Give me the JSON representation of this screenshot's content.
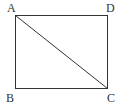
{
  "figure": {
    "type": "rectangle-with-diagonal",
    "stroke_color": "#333333",
    "background": "#ffffff",
    "vertices": [
      {
        "label": "A",
        "x": 15,
        "y": 15,
        "label_x": 7,
        "label_y": 12
      },
      {
        "label": "D",
        "x": 108,
        "y": 15,
        "label_x": 106,
        "label_y": 12
      },
      {
        "label": "B",
        "x": 15,
        "y": 89,
        "label_x": 6,
        "label_y": 102
      },
      {
        "label": "C",
        "x": 108,
        "y": 89,
        "label_x": 107,
        "label_y": 102
      }
    ],
    "segments": [
      {
        "from": "A",
        "to": "D",
        "name": "side-AD"
      },
      {
        "from": "D",
        "to": "C",
        "name": "side-DC"
      },
      {
        "from": "C",
        "to": "B",
        "name": "side-CB"
      },
      {
        "from": "B",
        "to": "A",
        "name": "side-BA"
      },
      {
        "from": "A",
        "to": "C",
        "name": "diagonal-AC"
      }
    ]
  },
  "labels": {
    "a": "A",
    "b": "B",
    "c": "C",
    "d": "D"
  }
}
